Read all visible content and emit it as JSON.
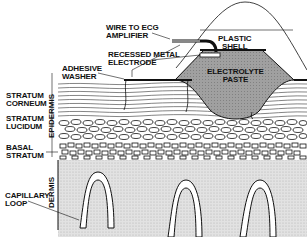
{
  "diagram": {
    "type": "skin-electrode-cross-section",
    "labels": {
      "wire": [
        "WIRE TO ECG",
        "AMPLIFIER"
      ],
      "shell": [
        "PLASTIC",
        "SHELL"
      ],
      "electrode": [
        "RECESSED METAL",
        "ELECTRODE"
      ],
      "washer": [
        "ADHESIVE",
        "WASHER"
      ],
      "paste": [
        "ELECTROLYTE",
        "PASTE"
      ],
      "corneum": [
        "STRATUM",
        "CORNEUM"
      ],
      "lucidum": [
        "STRATUM",
        "LUCIDUM"
      ],
      "basal": [
        "BASAL",
        "STRATUM"
      ],
      "capillary": [
        "CAPILLARY",
        "LOOP"
      ],
      "epidermis": "EPIDERMIS",
      "dermis": "DERMIS"
    },
    "colors": {
      "ink": "#111111",
      "paste": "#9a9a9a",
      "dermis": "#d9d9d9",
      "background": "#ffffff"
    }
  }
}
